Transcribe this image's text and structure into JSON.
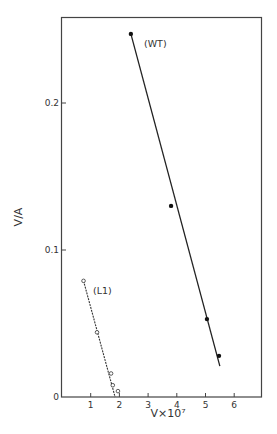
{
  "chart_data": {
    "type": "scatter",
    "title": "",
    "xlabel": "V×10⁷",
    "ylabel": "V/A",
    "xlim": [
      0,
      7
    ],
    "ylim": [
      0,
      0.26
    ],
    "x_ticks": [
      1,
      2,
      3,
      4,
      5,
      6
    ],
    "x_tick_labels": [
      "1",
      "2",
      "3",
      "4",
      "5",
      "6"
    ],
    "y_ticks": [
      0,
      0.1,
      0.2
    ],
    "y_tick_labels": [
      "0",
      "0.1",
      "0.2"
    ],
    "grid": false,
    "legend": "inline labels",
    "series": [
      {
        "name": "(WT)",
        "marker": "filled circle",
        "line": "solid fit",
        "x": [
          2.4,
          3.8,
          5.05,
          5.47
        ],
        "y": [
          0.247,
          0.13,
          0.053,
          0.028
        ],
        "fit_line": {
          "x": [
            2.4,
            5.5
          ],
          "y": [
            0.247,
            0.021
          ]
        }
      },
      {
        "name": "(L1)",
        "marker": "open circle",
        "line": "dashed fit",
        "x": [
          0.75,
          1.22,
          1.71,
          1.77,
          1.95
        ],
        "y": [
          0.079,
          0.044,
          0.016,
          0.008,
          0.004
        ],
        "fit_line": {
          "x": [
            0.75,
            1.85
          ],
          "y": [
            0.079,
            0.0
          ]
        }
      }
    ]
  }
}
